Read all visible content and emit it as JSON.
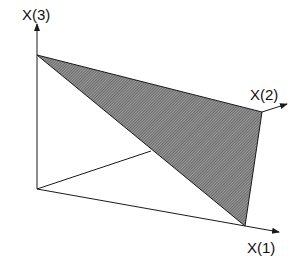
{
  "diagram": {
    "type": "3d-simplex",
    "axes": [
      {
        "id": "x1",
        "label": "X(1)"
      },
      {
        "id": "x2",
        "label": "X(2)"
      },
      {
        "id": "x3",
        "label": "X(3)"
      }
    ],
    "shaded_region": "triangle connecting unit points on X(1), X(2), X(3) axes",
    "colors": {
      "line": "#1a1a1a",
      "fill_dark": "#555555",
      "fill_light": "#9a9a9a",
      "background": "#ffffff"
    }
  }
}
